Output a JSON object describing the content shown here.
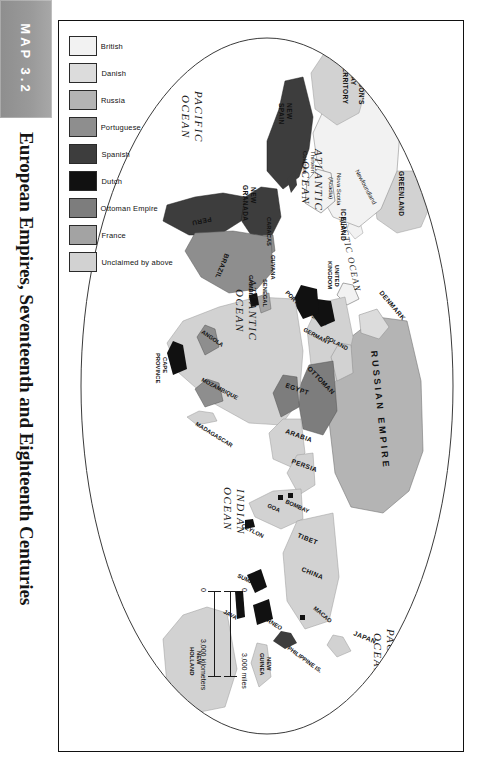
{
  "figure": {
    "map_number": "MAP 3.2",
    "title": "European Empires, Seventeenth and Eighteenth Centuries"
  },
  "legend": {
    "items": [
      {
        "label": "British",
        "color": "#f2f2f2"
      },
      {
        "label": "Danish",
        "color": "#dcdcdc"
      },
      {
        "label": "Russia",
        "color": "#b4b4b4"
      },
      {
        "label": "Portuguese",
        "color": "#8e8e8e"
      },
      {
        "label": "Spanish",
        "color": "#3d3d3d"
      },
      {
        "label": "Dutch",
        "color": "#111111"
      },
      {
        "label": "Ottoman Empire",
        "color": "#7d7d7d"
      },
      {
        "label": "France",
        "color": "#a3a3a3"
      },
      {
        "label": "Unclaimed by above",
        "color": "#d2d2d2"
      }
    ]
  },
  "scale": {
    "zero_miles": "0",
    "zero_km": "0",
    "miles": "3,000 miles",
    "kilometers": "3,000 kilometers"
  },
  "map_labels": {
    "oceans": [
      {
        "name": "ARCTIC OCEAN"
      },
      {
        "name": "ATLANTIC OCEAN"
      },
      {
        "name": "ATLANTIC OCEAN"
      },
      {
        "name": "PACIFIC OCEAN"
      },
      {
        "name": "PACIFIC OCEAN"
      },
      {
        "name": "INDIAN OCEAN"
      }
    ],
    "americas": [
      "HUDSON'S BAY TERRITORY",
      "Newfoundland",
      "Nova Scotia (Acadia)",
      "Thirteen Colonies",
      "NEW SPAIN",
      "NEW GRANADA",
      "CARACAS",
      "GUYANA",
      "PERU",
      "BRAZIL"
    ],
    "europe": [
      "GREENLAND",
      "ICELAND",
      "DENMARK",
      "UNITED KINGDOM",
      "FRANCE",
      "SPAIN",
      "PORTUGAL",
      "GERMANY",
      "POLAND",
      "RUSSIAN EMPIRE",
      "OTTOMAN"
    ],
    "africa": [
      "SENEGAL",
      "GAMBIA",
      "EGYPT",
      "ANGOLA",
      "MOZAMBIQUE",
      "CAPE PROVINCE",
      "MADAGASCAR"
    ],
    "asia_pacific": [
      "ARABIA",
      "PERSIA",
      "BOMBAY",
      "GOA",
      "CEYLON",
      "TIBET",
      "CHINA",
      "MACAO",
      "JAPAN",
      "PHILIPPINE IS.",
      "BORNEO",
      "SUMATRA",
      "JAVA",
      "NEW GUINEA",
      "NEW HOLLAND",
      "NEW ZEALAND"
    ]
  }
}
